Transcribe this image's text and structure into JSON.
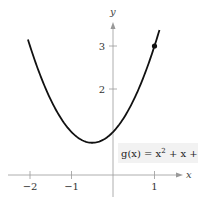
{
  "chart_data": {
    "type": "line",
    "title": "",
    "xlabel": "x",
    "ylabel": "y",
    "xlim": [
      -2.2,
      1.35
    ],
    "ylim": [
      -0.35,
      3.55
    ],
    "x_ticks": [
      -2,
      -1,
      1
    ],
    "x_tick_labels": [
      "−2",
      "−1",
      "1"
    ],
    "y_ticks": [
      2,
      3
    ],
    "y_tick_labels": [
      "2",
      "3"
    ],
    "grid": false,
    "series": [
      {
        "name": "g(x) = x² + x + 1",
        "function": "x^2 + x + 1",
        "x_range": [
          -2.05,
          1.12
        ],
        "x": [
          -2,
          -1.5,
          -1,
          -0.5,
          0,
          0.5,
          1
        ],
        "y": [
          3,
          1.75,
          1,
          0.75,
          1,
          1.75,
          3
        ]
      }
    ],
    "points": [
      {
        "x": 1,
        "y": 3,
        "label": ""
      }
    ],
    "annotations": [
      {
        "text_prefix": "g(x) = x",
        "superscript": "2",
        "text_suffix": " + x + 1",
        "x": 0.1,
        "y": 0.6
      }
    ],
    "legend": "none"
  },
  "labels": {
    "x_axis": "x",
    "y_axis": "y",
    "formula_prefix": "g(x) = x",
    "formula_sup": "2",
    "formula_suffix": " + x + 1"
  }
}
